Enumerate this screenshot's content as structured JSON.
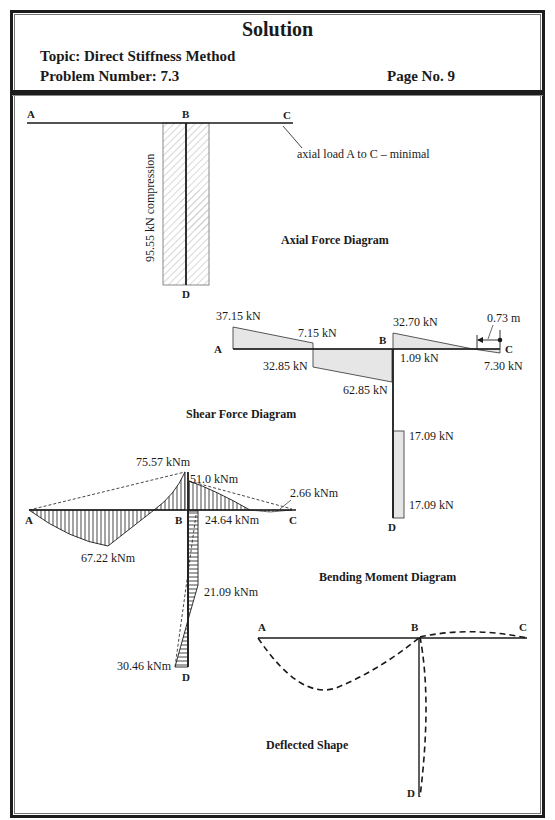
{
  "header": {
    "title": "Solution",
    "topic": "Topic:  Direct Stiffness Method",
    "problem_number": "Problem Number: 7.3",
    "page_no": "Page No. 9"
  },
  "nodes": {
    "a": "A",
    "b": "B",
    "c": "C",
    "d": "D"
  },
  "axial": {
    "caption": "Axial Force Diagram",
    "column_label": "95.55 kN compression",
    "beam_note": "axial load A to C – minimal"
  },
  "shear": {
    "caption": "Shear Force Diagram",
    "labels": {
      "a_top": "37.15 kN",
      "ab_mid_top": "7.15 kN",
      "ab_mid_bottom": "32.85 kN",
      "b_left_bottom": "62.85 kN",
      "b_right_top": "32.70 kN",
      "b_right_bottom": "1.09 kN",
      "c_bottom": "7.30 kN",
      "zero_distance": "0.73 m",
      "bd_top": "17.09 kN",
      "bd_bottom": "17.09 kN"
    }
  },
  "moment": {
    "caption": "Bending Moment Diagram",
    "labels": {
      "b_peak": "75.57 kNm",
      "b_right": "51.0 kNm",
      "c_near": "2.66 kNm",
      "ab_span": "67.22 kNm",
      "bc_span": "24.64 kNm",
      "bd_mid": "21.09 kNm",
      "d_base": "30.46 kNm"
    }
  },
  "deflected": {
    "caption": "Deflected Shape"
  }
}
